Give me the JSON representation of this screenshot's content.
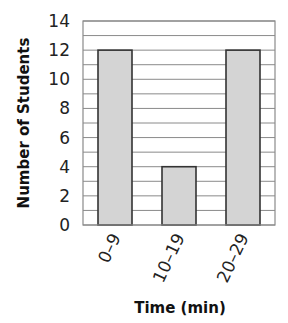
{
  "chart_data": {
    "type": "bar",
    "title": "",
    "xlabel": "Time (min)",
    "ylabel": "Number of Students",
    "categories": [
      "0–9",
      "10–19",
      "20–29"
    ],
    "values": [
      12,
      4,
      12
    ],
    "ylim": [
      0,
      14
    ],
    "yticks": [
      0,
      2,
      4,
      6,
      8,
      10,
      12,
      14
    ],
    "grid": {
      "horizontal": true,
      "step": 1
    },
    "legend": null,
    "colors": {
      "bar_fill": "#d4d4d4",
      "bar_stroke": "#333333",
      "grid": "#8a8a8a"
    }
  }
}
